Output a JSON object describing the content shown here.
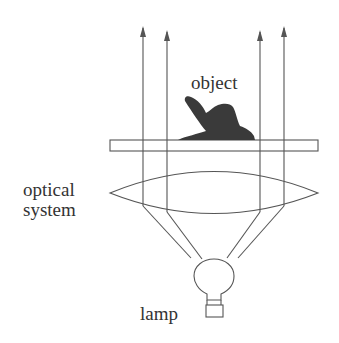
{
  "diagram": {
    "type": "optical-schematic",
    "labels": {
      "object": "object",
      "optical_system_line1": "optical",
      "optical_system_line2": "system",
      "lamp": "lamp"
    },
    "components": [
      "lamp",
      "optical system (lens)",
      "object plate",
      "object",
      "parallel light rays"
    ],
    "ray_count": 4,
    "colors": {
      "line": "#555555",
      "object_fill": "#3a3a3a",
      "text": "#333333",
      "background": "#ffffff"
    }
  }
}
